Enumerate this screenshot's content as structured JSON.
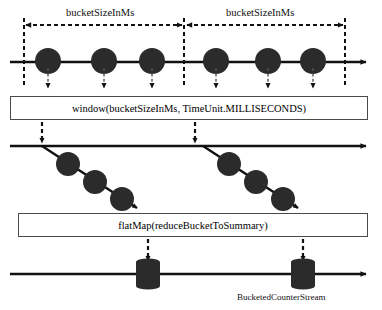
{
  "diagram": {
    "colors": {
      "ink": "#111111",
      "node_fill": "#2b2b2b",
      "box_stroke": "#4a4a4a",
      "background": "#ffffff"
    },
    "top_section": {
      "bucket_label_left": "bucketSizeInMs",
      "bucket_label_right": "bucketSizeInMs",
      "boundaries_x": [
        24,
        184,
        345
      ],
      "event_dots_x": [
        48,
        104,
        152,
        216,
        268,
        313
      ],
      "timeline_y": 62
    },
    "window_box": {
      "label": "window(bucketSizeInMs, TimeUnit.MILLISECONDS)",
      "x": 10,
      "y": 96,
      "width": 358,
      "height": 24
    },
    "middle_section": {
      "timeline_y": 146,
      "branch_origins_x": [
        42,
        203
      ],
      "branch_dots": [
        [
          [
            68,
            164
          ],
          [
            95,
            183
          ],
          [
            122,
            199
          ]
        ],
        [
          [
            229,
            164
          ],
          [
            256,
            183
          ],
          [
            283,
            199
          ]
        ]
      ],
      "drop_arrows_x": [
        42,
        195
      ]
    },
    "flatmap_box": {
      "label": "flatMap(reduceBucketToSummary)",
      "x": 18,
      "y": 213,
      "width": 350,
      "height": 24
    },
    "bottom_section": {
      "timeline_y": 274,
      "cylinders_x": [
        148,
        303
      ],
      "drop_arrows_x": [
        148,
        303
      ],
      "stream_label": "BucketedCounterStream"
    }
  }
}
